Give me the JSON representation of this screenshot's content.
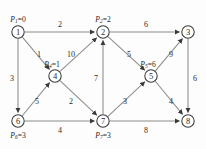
{
  "figure": {
    "node_radius": 6.2,
    "colors": {
      "edge": "#8c8c8c",
      "node_stroke": "#3a3a3a",
      "node_fill": "#ffffff",
      "text": "#2b2b2b",
      "background": "#fdfdfd"
    }
  },
  "chart_data": {
    "type": "diagram",
    "nodes": [
      {
        "id": "1",
        "label": "1",
        "x": 18,
        "y": 32,
        "potential_var": "P",
        "potential_sub": "1",
        "potential_value": "0",
        "potential_text": "P₁=0",
        "label_pos": "above"
      },
      {
        "id": "2",
        "label": "2",
        "x": 103,
        "y": 32,
        "potential_var": "P",
        "potential_sub": "2",
        "potential_value": "2",
        "potential_text": "P₂=2",
        "label_pos": "above"
      },
      {
        "id": "3",
        "label": "3",
        "x": 188,
        "y": 32,
        "potential_var": null,
        "potential_sub": null,
        "potential_value": null,
        "potential_text": "",
        "label_pos": "none"
      },
      {
        "id": "4",
        "label": "4",
        "x": 55,
        "y": 76,
        "potential_var": "P",
        "potential_sub": "4",
        "potential_value": "1",
        "potential_text": "P₄=1",
        "label_pos": "above-left"
      },
      {
        "id": "5",
        "label": "5",
        "x": 151,
        "y": 76,
        "potential_var": "P",
        "potential_sub": "5",
        "potential_value": "6",
        "potential_text": "P₅=6",
        "label_pos": "above-left"
      },
      {
        "id": "6",
        "label": "6",
        "x": 18,
        "y": 121,
        "potential_var": "P",
        "potential_sub": "6",
        "potential_value": "3",
        "potential_text": "P₆=3",
        "label_pos": "below"
      },
      {
        "id": "7",
        "label": "7",
        "x": 103,
        "y": 121,
        "potential_var": "P",
        "potential_sub": "7",
        "potential_value": "3",
        "potential_text": "P₇=3",
        "label_pos": "below"
      },
      {
        "id": "8",
        "label": "8",
        "x": 188,
        "y": 121,
        "potential_var": null,
        "potential_sub": null,
        "potential_value": null,
        "potential_text": "",
        "label_pos": "none"
      }
    ],
    "edges": [
      {
        "from": "1",
        "to": "2",
        "weight": "2",
        "wx": 60,
        "wy": 24
      },
      {
        "from": "1",
        "to": "4",
        "weight": "1",
        "wx": 39,
        "wy": 54
      },
      {
        "from": "1",
        "to": "6",
        "weight": "3",
        "wx": 12,
        "wy": 78
      },
      {
        "from": "4",
        "to": "2",
        "weight": "10",
        "wx": 71,
        "wy": 54
      },
      {
        "from": "4",
        "to": "7",
        "weight": "2",
        "wx": 71,
        "wy": 101
      },
      {
        "from": "6",
        "to": "4",
        "weight": "5",
        "wx": 37,
        "wy": 101
      },
      {
        "from": "6",
        "to": "7",
        "weight": "4",
        "wx": 60,
        "wy": 130
      },
      {
        "from": "7",
        "to": "2",
        "weight": "7",
        "wx": 96,
        "wy": 78
      },
      {
        "from": "7",
        "to": "5",
        "weight": "3",
        "wx": 125,
        "wy": 101
      },
      {
        "from": "7",
        "to": "8",
        "weight": "8",
        "wx": 146,
        "wy": 130
      },
      {
        "from": "2",
        "to": "3",
        "weight": "6",
        "wx": 146,
        "wy": 24
      },
      {
        "from": "2",
        "to": "5",
        "weight": "5",
        "wx": 129,
        "wy": 54
      },
      {
        "from": "5",
        "to": "3",
        "weight": "9",
        "wx": 171,
        "wy": 54
      },
      {
        "from": "5",
        "to": "8",
        "weight": "4",
        "wx": 171,
        "wy": 101
      },
      {
        "from": "3",
        "to": "8",
        "weight": "6",
        "wx": 195,
        "wy": 78
      }
    ]
  }
}
